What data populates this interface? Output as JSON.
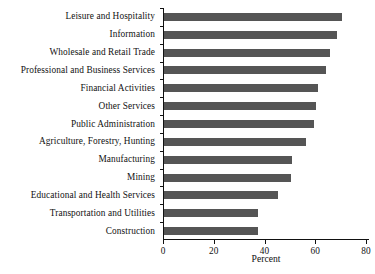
{
  "chart_data": {
    "type": "bar",
    "orientation": "horizontal",
    "title": "",
    "xlabel": "Percent",
    "ylabel": "",
    "xlim": [
      0,
      80
    ],
    "xticks": [
      0,
      20,
      40,
      60,
      80
    ],
    "grid": false,
    "legend": null,
    "bar_color": "#555555",
    "axis_color": "#111111",
    "categories": [
      "Leisure and Hospitality",
      "Information",
      "Wholesale and Retail Trade",
      "Professional and Business Services",
      "Financial Activities",
      "Other Services",
      "Public Administration",
      "Agriculture, Forestry, Hunting",
      "Manufacturing",
      "Mining",
      "Educational and Health Services",
      "Transportation and Utilities",
      "Construction"
    ],
    "values": [
      70,
      68,
      65.5,
      64,
      60.5,
      60,
      59,
      56,
      50.5,
      50,
      45,
      37,
      37
    ]
  }
}
